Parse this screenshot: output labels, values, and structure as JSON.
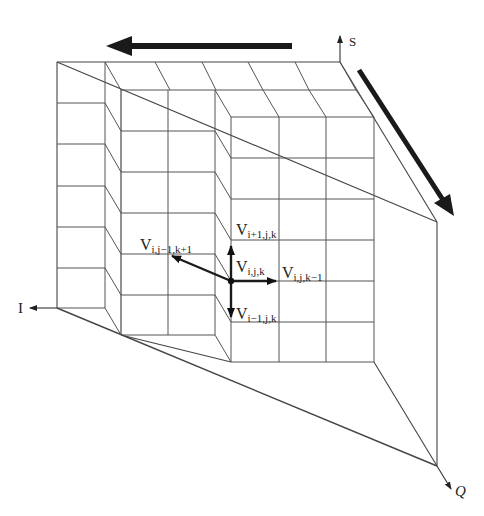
{
  "diagram": {
    "type": "3D grid stencil diagram",
    "axes": {
      "s": "S",
      "i": "I",
      "q": "Q"
    },
    "nodes": {
      "center": {
        "base": "V",
        "sub": "i,j,k"
      },
      "up": {
        "base": "V",
        "sub": "i+1,j,k"
      },
      "down": {
        "base": "V",
        "sub": "i−1,j,k"
      },
      "right": {
        "base": "V",
        "sub": "i,j,k−1"
      },
      "back": {
        "base": "V",
        "sub": "i,j−1,k+1"
      }
    },
    "flow_arrows": [
      {
        "direction": "left",
        "description": "top horizontal thick arrow"
      },
      {
        "direction": "down-right",
        "description": "right diagonal thick arrow"
      }
    ],
    "colors": {
      "line": "#333333",
      "arrow": "#1a1a1a"
    }
  }
}
